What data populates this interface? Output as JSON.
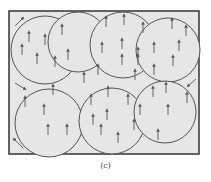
{
  "figure": {
    "caption": "(c)",
    "colors": {
      "background": "#e6e6e6",
      "stroke": "#555555",
      "border": "#333333"
    },
    "frame": {
      "x": 9,
      "y": 11,
      "w": 190,
      "h": 143
    },
    "domains": [
      {
        "cx": 45,
        "cy": 50,
        "r": 34
      },
      {
        "cx": 78,
        "cy": 42,
        "r": 30,
        "rx": 30
      },
      {
        "cx": 123,
        "cy": 45,
        "r": 33
      },
      {
        "cx": 168,
        "cy": 50,
        "r": 32
      },
      {
        "cx": 49,
        "cy": 123,
        "r": 34
      },
      {
        "cx": 112,
        "cy": 121,
        "r": 33
      },
      {
        "cx": 165,
        "cy": 112,
        "r": 31
      }
    ],
    "arrows": [
      [
        29,
        37
      ],
      [
        45,
        40
      ],
      [
        62,
        30
      ],
      [
        22,
        50
      ],
      [
        37,
        59
      ],
      [
        55,
        62
      ],
      [
        68,
        55
      ],
      [
        106,
        22
      ],
      [
        124,
        20
      ],
      [
        143,
        28
      ],
      [
        102,
        48
      ],
      [
        122,
        44
      ],
      [
        138,
        53
      ],
      [
        154,
        48
      ],
      [
        122,
        60
      ],
      [
        138,
        60
      ],
      [
        154,
        70
      ],
      [
        172,
        24
      ],
      [
        186,
        31
      ],
      [
        179,
        46
      ],
      [
        173,
        61
      ],
      [
        98,
        70
      ],
      [
        135,
        75
      ],
      [
        84,
        78
      ],
      [
        25,
        102
      ],
      [
        53,
        90
      ],
      [
        44,
        110
      ],
      [
        48,
        130
      ],
      [
        67,
        130
      ],
      [
        91,
        100
      ],
      [
        108,
        92
      ],
      [
        128,
        100
      ],
      [
        93,
        120
      ],
      [
        107,
        115
      ],
      [
        101,
        130
      ],
      [
        118,
        138
      ],
      [
        134,
        125
      ],
      [
        140,
        110
      ],
      [
        153,
        92
      ],
      [
        166,
        88
      ],
      [
        187,
        98
      ],
      [
        168,
        110
      ],
      [
        158,
        135
      ]
    ],
    "corner_arrows": [
      {
        "x1": 15,
        "y1": 26,
        "x2": 23,
        "y2": 18
      },
      {
        "x1": 15,
        "y1": 83,
        "x2": 25,
        "y2": 89
      },
      {
        "x1": 196,
        "y1": 79,
        "x2": 188,
        "y2": 86
      },
      {
        "x1": 23,
        "y1": 148,
        "x2": 14,
        "y2": 139
      }
    ]
  }
}
